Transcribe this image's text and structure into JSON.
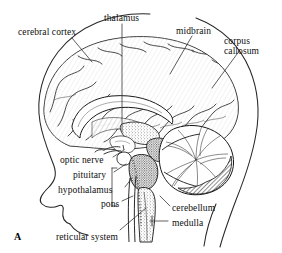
{
  "figure": {
    "marker": "A"
  },
  "labels": [
    {
      "id": "cerebral-cortex",
      "text": "cerebral cortex",
      "x": 18,
      "y": 27
    },
    {
      "id": "thalamus",
      "text": "thalamus",
      "x": 104,
      "y": 13
    },
    {
      "id": "midbrain",
      "text": "midbrain",
      "x": 176,
      "y": 26
    },
    {
      "id": "corpus-callosum",
      "text": "corpus callosum",
      "x": 224,
      "y": 36
    },
    {
      "id": "optic-nerve",
      "text": "optic nerve",
      "x": 60,
      "y": 155
    },
    {
      "id": "pituitary",
      "text": "pituitary",
      "x": 73,
      "y": 170
    },
    {
      "id": "hypothalamus",
      "text": "hypothalamus",
      "x": 58,
      "y": 185
    },
    {
      "id": "pons",
      "text": "pons",
      "x": 101,
      "y": 199
    },
    {
      "id": "cerebellum",
      "text": "cerebellum",
      "x": 172,
      "y": 203
    },
    {
      "id": "medulla",
      "text": "medulla",
      "x": 172,
      "y": 218
    },
    {
      "id": "reticular-system",
      "text": "reticular system",
      "x": 56,
      "y": 232
    }
  ],
  "colors": {
    "background": "#ffffff",
    "ink": "#1a1a1a",
    "label_text": "#0d0d0d",
    "leader_line": "#2b2b2b",
    "shading_light": "#cfcfcf",
    "shading_mid": "#8f8f8f",
    "shading_dark": "#3a3a3a"
  }
}
